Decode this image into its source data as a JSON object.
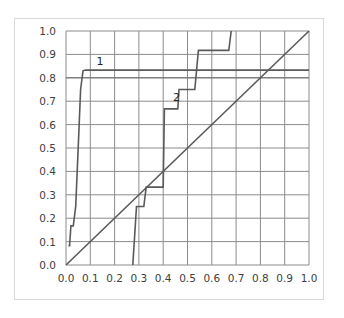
{
  "chart_data": {
    "type": "line",
    "title": "",
    "xlabel": "",
    "ylabel": "",
    "xlim": [
      0.0,
      1.0
    ],
    "ylim": [
      0.0,
      1.0
    ],
    "grid": true,
    "legend": "none",
    "x_ticks": [
      "0.0",
      "0.1",
      "0.2",
      "0.3",
      "0.4",
      "0.5",
      "0.6",
      "0.7",
      "0.8",
      "0.9",
      "1.0"
    ],
    "y_ticks": [
      "0.0",
      "0.1",
      "0.2",
      "0.3",
      "0.4",
      "0.5",
      "0.6",
      "0.7",
      "0.8",
      "0.9",
      "1.0"
    ],
    "series": [
      {
        "name": "1",
        "label_pos": [
          0.14,
          0.855
        ],
        "points": [
          [
            0.01,
            0.083
          ],
          [
            0.015,
            0.083
          ],
          [
            0.02,
            0.167
          ],
          [
            0.03,
            0.167
          ],
          [
            0.04,
            0.25
          ],
          [
            0.05,
            0.5
          ],
          [
            0.06,
            0.75
          ],
          [
            0.07,
            0.83
          ],
          [
            0.08,
            0.833
          ],
          [
            1.0,
            0.833
          ]
        ]
      },
      {
        "name": "2",
        "label_pos": [
          0.455,
          0.7
        ],
        "points": [
          [
            0.275,
            0.0
          ],
          [
            0.29,
            0.25
          ],
          [
            0.32,
            0.25
          ],
          [
            0.33,
            0.333
          ],
          [
            0.4,
            0.333
          ],
          [
            0.405,
            0.667
          ],
          [
            0.46,
            0.667
          ],
          [
            0.465,
            0.75
          ],
          [
            0.53,
            0.75
          ],
          [
            0.545,
            0.917
          ],
          [
            0.67,
            0.917
          ],
          [
            0.68,
            1.0
          ]
        ]
      },
      {
        "name": "diagonal",
        "points": [
          [
            0.0,
            0.0
          ],
          [
            1.0,
            1.0
          ]
        ]
      }
    ],
    "extra_hlines": [
      0.8
    ]
  }
}
